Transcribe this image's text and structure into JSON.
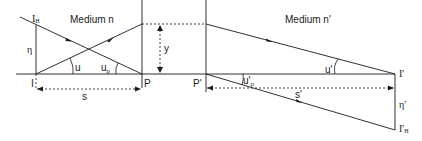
{
  "diagram": {
    "media": {
      "left": "Medium n",
      "right": "Medium n'"
    },
    "points": {
      "object": "I",
      "object_height_tip": "I",
      "object_height_tip_sub": "H",
      "surface1": "P",
      "surface2": "P'",
      "image": "I'",
      "image_height_tip": "I'",
      "image_height_tip_sub": "H"
    },
    "quantities": {
      "object_height": "η",
      "image_height": "η'",
      "object_distance": "s",
      "image_distance": "s'",
      "ray_height": "y",
      "angle_u": "u",
      "angle_up": "u",
      "angle_up_sub": "p",
      "angle_u_prime": "u'",
      "angle_up_prime": "u'",
      "angle_up_prime_sub": "p"
    },
    "colors": {
      "line": "#1a1a1a",
      "background": "#ffffff"
    }
  }
}
